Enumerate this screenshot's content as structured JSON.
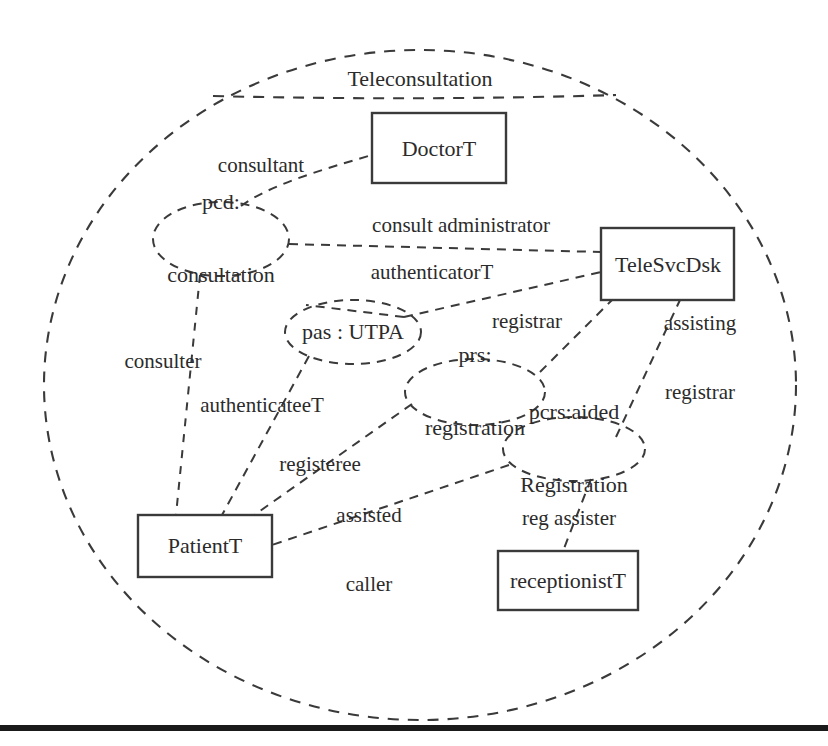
{
  "diagram": {
    "title_label": "Teleconsultation",
    "style": {
      "stroke": "#3a3a3a",
      "text_color": "#2b2b2b",
      "background": "#ffffff",
      "rule_color": "#1a1a1a"
    },
    "collaboration": {
      "name": "Teleconsultation",
      "shape": "dashed-ellipse",
      "cx": 420,
      "cy": 385,
      "rx": 376,
      "ry": 335
    },
    "classifiers": [
      {
        "id": "doctorT",
        "label": "DoctorT",
        "shape": "rectangle",
        "x": 372,
        "y": 113,
        "w": 134,
        "h": 70
      },
      {
        "id": "teleSvcDsk",
        "label": "TeleSvcDsk",
        "shape": "rectangle",
        "x": 601,
        "y": 228,
        "w": 133,
        "h": 72
      },
      {
        "id": "patientT",
        "label": "PatientT",
        "shape": "rectangle",
        "x": 138,
        "y": 515,
        "w": 134,
        "h": 62
      },
      {
        "id": "receptionistT",
        "label": "receptionistT",
        "shape": "rectangle",
        "x": 498,
        "y": 551,
        "w": 140,
        "h": 59
      }
    ],
    "collaboration_uses": [
      {
        "id": "pcd",
        "label": "pcd:\nconsultation",
        "line1": "pcd:",
        "line2": "consultation",
        "shape": "dashed-ellipse",
        "cx": 221,
        "cy": 239,
        "rx": 68,
        "ry": 37
      },
      {
        "id": "pas",
        "label": "pas : UTPA",
        "line1": "pas : UTPA",
        "line2": "",
        "shape": "dashed-ellipse",
        "cx": 353,
        "cy": 332,
        "rx": 68,
        "ry": 32
      },
      {
        "id": "prs",
        "label": "prs:\nregistration",
        "line1": "prs:",
        "line2": "registration",
        "shape": "dashed-ellipse",
        "cx": 475,
        "cy": 392,
        "rx": 70,
        "ry": 33
      },
      {
        "id": "pcrs",
        "label": "pcrs:aided\nRegistration",
        "line1": "pcrs:aided",
        "line2": "Registration",
        "shape": "dashed-ellipse",
        "cx": 574,
        "cy": 449,
        "rx": 71,
        "ry": 32
      }
    ],
    "roles": [
      {
        "id": "consultant",
        "label": "consultant",
        "x": 261,
        "y": 166,
        "from": "pcd",
        "to": "doctorT"
      },
      {
        "id": "consult-administrator",
        "label": "consult administrator",
        "x": 461,
        "y": 226,
        "from": "pcd",
        "to": "teleSvcDsk"
      },
      {
        "id": "authenticatorT",
        "label": "authenticatorT",
        "x": 432,
        "y": 273,
        "from": "pas",
        "to": "teleSvcDsk"
      },
      {
        "id": "registrar",
        "label": "registrar",
        "x": 527,
        "y": 322,
        "from": "prs",
        "to": "teleSvcDsk"
      },
      {
        "id": "assisting-registrar",
        "label": "assisting\nregistrar",
        "line1": "assisting",
        "line2": "registrar",
        "x": 700,
        "y": 358,
        "from": "pcrs",
        "to": "teleSvcDsk"
      },
      {
        "id": "consulter",
        "label": "consulter",
        "x": 163,
        "y": 362,
        "from": "pcd",
        "to": "patientT"
      },
      {
        "id": "authenticateeT",
        "label": "authenticateeT",
        "x": 262,
        "y": 406,
        "from": "pas",
        "to": "patientT"
      },
      {
        "id": "registeree",
        "label": "registeree",
        "x": 320,
        "y": 465,
        "from": "prs",
        "to": "patientT"
      },
      {
        "id": "assisted-caller",
        "label": "assisted\ncaller",
        "line1": "assisted",
        "line2": "caller",
        "x": 369,
        "y": 550,
        "from": "pcrs",
        "to": "patientT"
      },
      {
        "id": "reg-assister",
        "label": "reg assister",
        "x": 569,
        "y": 519,
        "from": "pcrs",
        "to": "receptionistT"
      }
    ],
    "bottom_rule": {
      "present": true,
      "y": 728,
      "thickness": 6
    }
  }
}
